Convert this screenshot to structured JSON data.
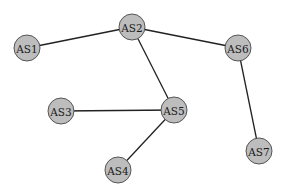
{
  "diagram": {
    "type": "network-graph",
    "nodes": [
      {
        "id": "AS1",
        "label": "AS1",
        "x": 27,
        "y": 48
      },
      {
        "id": "AS2",
        "label": "AS2",
        "x": 132,
        "y": 27
      },
      {
        "id": "AS3",
        "label": "AS3",
        "x": 61,
        "y": 111
      },
      {
        "id": "AS4",
        "label": "AS4",
        "x": 118,
        "y": 170
      },
      {
        "id": "AS5",
        "label": "AS5",
        "x": 174,
        "y": 110
      },
      {
        "id": "AS6",
        "label": "AS6",
        "x": 238,
        "y": 48
      },
      {
        "id": "AS7",
        "label": "AS7",
        "x": 259,
        "y": 151
      }
    ],
    "edges": [
      {
        "from": "AS1",
        "to": "AS2"
      },
      {
        "from": "AS2",
        "to": "AS6"
      },
      {
        "from": "AS2",
        "to": "AS5"
      },
      {
        "from": "AS3",
        "to": "AS5"
      },
      {
        "from": "AS4",
        "to": "AS5"
      },
      {
        "from": "AS6",
        "to": "AS7"
      }
    ],
    "node_radius": 13,
    "colors": {
      "node_fill": "#bdbdbd",
      "node_stroke": "#555555",
      "edge": "#222222",
      "background": "#ffffff"
    }
  }
}
